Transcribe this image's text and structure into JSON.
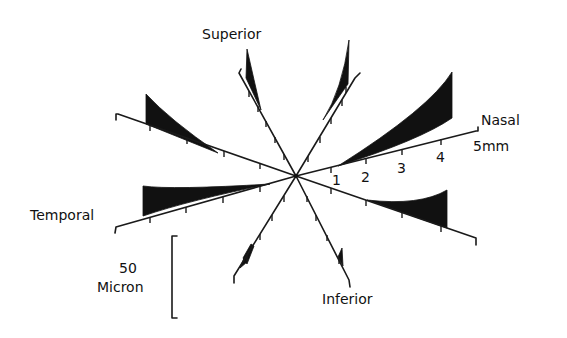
{
  "diagram": {
    "labels": {
      "superior": "Superior",
      "nasal": "Nasal",
      "temporal": "Temporal",
      "inferior": "Inferior",
      "distance_unit": "5mm",
      "scale_value": "50",
      "scale_unit": "Micron"
    },
    "tick_numbers": [
      "1",
      "2",
      "3",
      "4"
    ],
    "meridians": [
      {
        "name": "nasal",
        "direction": "right, slightly up",
        "ticks_mm": [
          1,
          2,
          3,
          4,
          5
        ],
        "shaded_from_mm": 1.5,
        "shaded_to_mm": 4.2,
        "max_height": "large"
      },
      {
        "name": "nasal-inferior",
        "direction": "right, slightly down",
        "ticks_mm": [
          1,
          2,
          3,
          4,
          5
        ],
        "shaded_from_mm": 2,
        "shaded_to_mm": 4.2,
        "max_height": "medium"
      },
      {
        "name": "temporal",
        "direction": "left, slightly down",
        "ticks_mm": [
          1,
          2,
          3,
          4,
          5
        ],
        "shaded_from_mm": 1.5,
        "shaded_to_mm": 4.2,
        "max_height": "medium"
      },
      {
        "name": "temporal-superior",
        "direction": "left, slightly up",
        "ticks_mm": [
          1,
          2,
          3,
          4,
          5
        ],
        "shaded_from_mm": 2.5,
        "shaded_to_mm": 4.2,
        "max_height": "medium"
      },
      {
        "name": "superior-left",
        "direction": "up-left",
        "ticks_mm": [
          1,
          2,
          3,
          4,
          5
        ],
        "shaded_from_mm": 3,
        "shaded_to_mm": 4.8,
        "max_height": "small"
      },
      {
        "name": "superior-right",
        "direction": "up-right",
        "ticks_mm": [
          1,
          2,
          3,
          4,
          5
        ],
        "shaded_from_mm": 2.3,
        "shaded_to_mm": 4.8,
        "max_height": "small"
      },
      {
        "name": "inferior-left",
        "direction": "down-left",
        "ticks_mm": [
          1,
          2,
          3,
          4,
          5
        ],
        "shaded_from_mm": 3.5,
        "shaded_to_mm": 4.2,
        "max_height": "tiny"
      },
      {
        "name": "inferior-right",
        "direction": "down-right",
        "ticks_mm": [
          1,
          2,
          3,
          4,
          5
        ],
        "shaded_from_mm": 3.7,
        "shaded_to_mm": 4.3,
        "max_height": "tiny"
      }
    ],
    "colors": {
      "ink": "#111111",
      "background": "#ffffff"
    }
  }
}
